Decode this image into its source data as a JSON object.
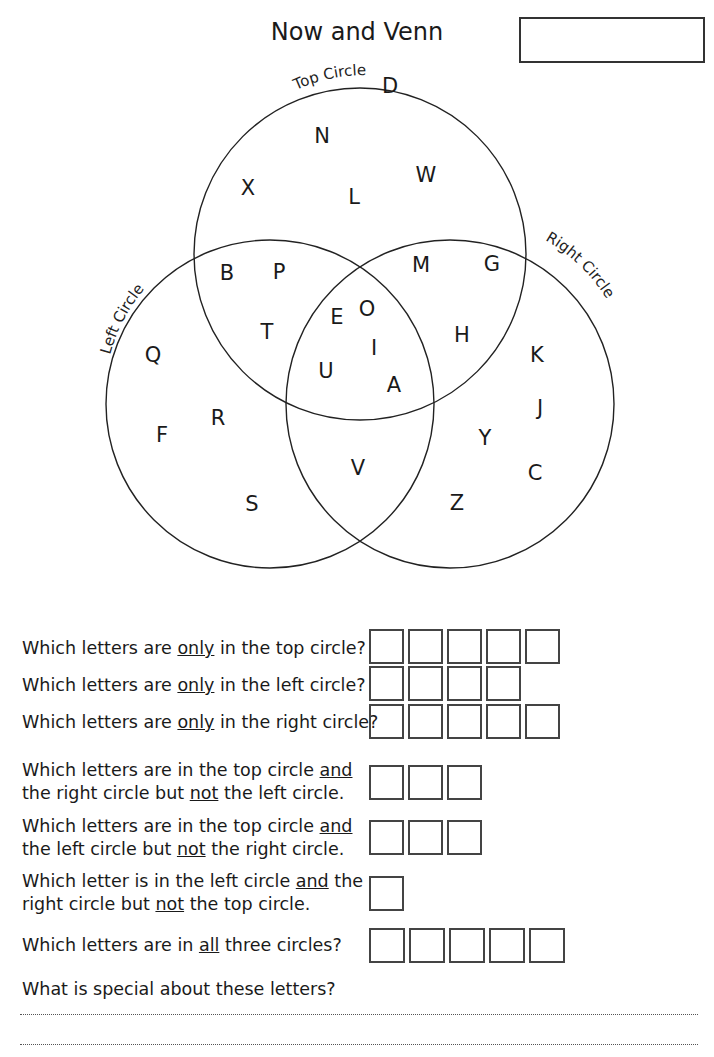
{
  "page": {
    "title": "Now and Venn",
    "name_box": ""
  },
  "venn": {
    "labels": {
      "top": "Top Circle",
      "left": "Left Circle",
      "right": "Right Circle"
    },
    "circles": {
      "top": {
        "cx": 360,
        "cy": 254,
        "r": 166
      },
      "left": {
        "cx": 270,
        "cy": 404,
        "r": 164
      },
      "right": {
        "cx": 450,
        "cy": 404,
        "r": 164
      }
    },
    "letters": [
      {
        "ch": "D",
        "x": 390,
        "y": 85
      },
      {
        "ch": "N",
        "x": 322,
        "y": 135
      },
      {
        "ch": "X",
        "x": 248,
        "y": 187
      },
      {
        "ch": "L",
        "x": 354,
        "y": 196
      },
      {
        "ch": "W",
        "x": 426,
        "y": 174
      },
      {
        "ch": "B",
        "x": 227,
        "y": 272
      },
      {
        "ch": "P",
        "x": 279,
        "y": 271
      },
      {
        "ch": "M",
        "x": 421,
        "y": 264
      },
      {
        "ch": "G",
        "x": 492,
        "y": 263
      },
      {
        "ch": "E",
        "x": 337,
        "y": 316
      },
      {
        "ch": "O",
        "x": 367,
        "y": 308
      },
      {
        "ch": "T",
        "x": 267,
        "y": 331
      },
      {
        "ch": "I",
        "x": 374,
        "y": 347
      },
      {
        "ch": "H",
        "x": 462,
        "y": 334
      },
      {
        "ch": "Q",
        "x": 153,
        "y": 354
      },
      {
        "ch": "K",
        "x": 537,
        "y": 354
      },
      {
        "ch": "U",
        "x": 326,
        "y": 370
      },
      {
        "ch": "A",
        "x": 394,
        "y": 384
      },
      {
        "ch": "J",
        "x": 540,
        "y": 407
      },
      {
        "ch": "R",
        "x": 218,
        "y": 417
      },
      {
        "ch": "F",
        "x": 162,
        "y": 434
      },
      {
        "ch": "Y",
        "x": 485,
        "y": 437
      },
      {
        "ch": "V",
        "x": 358,
        "y": 467
      },
      {
        "ch": "C",
        "x": 535,
        "y": 472
      },
      {
        "ch": "S",
        "x": 252,
        "y": 503
      },
      {
        "ch": "Z",
        "x": 457,
        "y": 502
      }
    ]
  },
  "questions": [
    {
      "parts": [
        "Which letters are ",
        "only",
        " in the top circle?"
      ],
      "boxes": 5
    },
    {
      "parts": [
        "Which letters are ",
        "only",
        " in the left circle?"
      ],
      "boxes": 4
    },
    {
      "parts": [
        "Which letters are ",
        "only",
        " in the right circle?"
      ],
      "boxes": 5
    },
    {
      "line1": [
        "Which letters are in the top circle ",
        "and",
        ""
      ],
      "line2": [
        "the right circle but ",
        "not",
        " the left circle."
      ],
      "boxes": 3
    },
    {
      "line1": [
        "Which letters are in the top circle ",
        "and",
        ""
      ],
      "line2": [
        "the left circle but ",
        "not",
        " the right circle."
      ],
      "boxes": 3
    },
    {
      "line1": [
        "Which letter is in the left circle ",
        "and",
        " the"
      ],
      "line2": [
        "right circle but ",
        "not",
        " the top circle."
      ],
      "boxes": 1
    },
    {
      "parts": [
        "Which letters are in ",
        "all",
        " three circles?"
      ],
      "boxes": 5
    },
    {
      "text": "What is special about these letters?"
    }
  ]
}
